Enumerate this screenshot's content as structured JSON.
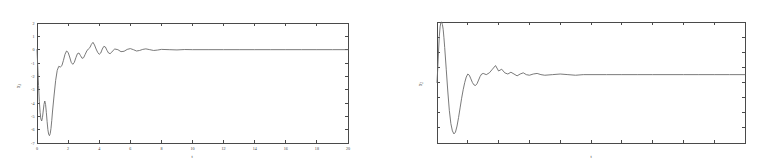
{
  "figure": {
    "caption": "",
    "background_color": "#ffffff",
    "curve_color": "#6b6b6b",
    "axis_color": "#4a4a4a"
  },
  "panels": [
    {
      "id": "left",
      "name": "left-plot",
      "ylabel": "x",
      "ylabel_sub": "1",
      "xlabel": "t",
      "x_tick_labels": [
        "0",
        "2",
        "4",
        "6",
        "8",
        "10",
        "12",
        "14",
        "16",
        "18",
        "20"
      ],
      "y_tick_labels": [
        "2",
        "1",
        "0",
        "-1",
        "-2",
        "-3",
        "-4",
        "-5",
        "-6",
        "-7"
      ]
    },
    {
      "id": "right",
      "name": "right-plot",
      "ylabel": "x",
      "ylabel_sub": "2",
      "xlabel": "t",
      "x_tick_labels": [
        "",
        "",
        "",
        "",
        "",
        "",
        "",
        "",
        "",
        "",
        ""
      ],
      "y_tick_labels": [
        "",
        "",
        "",
        "",
        "",
        "",
        "",
        ""
      ]
    }
  ],
  "chart_data": [
    {
      "type": "line",
      "id": "left",
      "title": "",
      "xlabel": "t",
      "ylabel": "x1",
      "xlim": [
        0,
        20
      ],
      "ylim": [
        -7,
        2
      ],
      "grid": false,
      "legend": "none",
      "xticks": [
        0,
        2,
        4,
        6,
        8,
        10,
        12,
        14,
        16,
        18,
        20
      ],
      "yticks": [
        2,
        1,
        0,
        -1,
        -2,
        -3,
        -4,
        -5,
        -6,
        -7
      ],
      "series": [
        {
          "name": "x1",
          "x": [
            0.0,
            0.05,
            0.1,
            0.15,
            0.2,
            0.25,
            0.3,
            0.35,
            0.4,
            0.45,
            0.5,
            0.55,
            0.6,
            0.65,
            0.7,
            0.75,
            0.8,
            0.85,
            0.9,
            0.95,
            1.0,
            1.1,
            1.2,
            1.3,
            1.4,
            1.5,
            1.6,
            1.7,
            1.8,
            1.9,
            2.0,
            2.1,
            2.2,
            2.3,
            2.4,
            2.5,
            2.6,
            2.7,
            2.8,
            2.9,
            3.0,
            3.1,
            3.2,
            3.3,
            3.4,
            3.5,
            3.6,
            3.7,
            3.8,
            3.9,
            4.0,
            4.1,
            4.2,
            4.3,
            4.4,
            4.5,
            4.6,
            4.7,
            4.8,
            4.9,
            5.0,
            5.2,
            5.4,
            5.6,
            5.8,
            6.0,
            6.2,
            6.4,
            6.6,
            6.8,
            7.0,
            7.25,
            7.5,
            7.75,
            8.0,
            8.5,
            9.0,
            9.5,
            10.0,
            11.0,
            12.0,
            13.0,
            14.0,
            15.0,
            16.0,
            17.0,
            18.0,
            19.0,
            20.0
          ],
          "y": [
            0.0,
            -1.3,
            -2.7,
            -3.9,
            -4.7,
            -5.2,
            -5.35,
            -5.1,
            -4.6,
            -4.1,
            -3.85,
            -4.1,
            -4.7,
            -5.4,
            -6.0,
            -6.35,
            -6.45,
            -6.3,
            -5.9,
            -5.3,
            -4.6,
            -3.4,
            -2.3,
            -1.55,
            -1.25,
            -1.3,
            -1.2,
            -0.8,
            -0.35,
            -0.1,
            -0.2,
            -0.55,
            -0.95,
            -1.1,
            -0.95,
            -0.6,
            -0.3,
            -0.25,
            -0.45,
            -0.65,
            -0.6,
            -0.35,
            -0.1,
            0.05,
            0.15,
            0.4,
            0.55,
            0.35,
            0.05,
            -0.2,
            -0.35,
            -0.25,
            0.05,
            0.25,
            0.2,
            -0.05,
            -0.25,
            -0.3,
            -0.2,
            -0.05,
            0.05,
            0.0,
            -0.15,
            -0.12,
            0.02,
            0.08,
            0.0,
            -0.1,
            -0.06,
            0.02,
            0.06,
            0.0,
            -0.06,
            -0.03,
            0.02,
            0.0,
            -0.02,
            0.01,
            0.0,
            0.0,
            0.0,
            0.0,
            0.0,
            0.0,
            0.0,
            0.0,
            0.0,
            0.0,
            0.0
          ]
        }
      ]
    },
    {
      "type": "line",
      "id": "right",
      "title": "",
      "xlabel": "t",
      "ylabel": "x2",
      "xlim": [
        0,
        20
      ],
      "ylim": [
        -1.0,
        1.0
      ],
      "grid": false,
      "legend": "none",
      "xticks": [
        0,
        2,
        4,
        6,
        8,
        10,
        12,
        14,
        16,
        18,
        20
      ],
      "yticks": [
        1.0,
        0.75,
        0.5,
        0.25,
        0.0,
        -0.25,
        -0.5,
        -0.75,
        -1.0
      ],
      "series": [
        {
          "name": "x2",
          "x": [
            0.0,
            0.05,
            0.1,
            0.15,
            0.2,
            0.25,
            0.3,
            0.35,
            0.4,
            0.45,
            0.5,
            0.6,
            0.7,
            0.8,
            0.9,
            1.0,
            1.1,
            1.2,
            1.3,
            1.4,
            1.5,
            1.6,
            1.7,
            1.8,
            1.9,
            2.0,
            2.1,
            2.2,
            2.3,
            2.4,
            2.5,
            2.6,
            2.7,
            2.8,
            2.9,
            3.0,
            3.2,
            3.4,
            3.6,
            3.8,
            4.0,
            4.2,
            4.4,
            4.6,
            4.8,
            5.0,
            5.2,
            5.4,
            5.6,
            5.8,
            6.0,
            6.25,
            6.5,
            6.75,
            7.0,
            7.5,
            8.0,
            8.5,
            9.0,
            9.5,
            10.0,
            11.0,
            12.0,
            13.0,
            14.0,
            15.0,
            16.0,
            17.0,
            18.0,
            19.0,
            20.0
          ],
          "y": [
            0.0,
            0.24,
            0.52,
            0.76,
            0.92,
            0.99,
            1.0,
            0.96,
            0.88,
            0.74,
            0.58,
            0.22,
            -0.14,
            -0.46,
            -0.68,
            -0.8,
            -0.85,
            -0.82,
            -0.72,
            -0.58,
            -0.42,
            -0.26,
            -0.12,
            0.0,
            0.09,
            0.14,
            0.12,
            0.06,
            0.0,
            -0.04,
            -0.05,
            -0.02,
            0.04,
            0.1,
            0.14,
            0.15,
            0.13,
            0.16,
            0.22,
            0.28,
            0.19,
            0.22,
            0.16,
            0.14,
            0.17,
            0.14,
            0.11,
            0.14,
            0.16,
            0.13,
            0.12,
            0.14,
            0.15,
            0.13,
            0.12,
            0.13,
            0.14,
            0.13,
            0.12,
            0.13,
            0.13,
            0.13,
            0.13,
            0.13,
            0.13,
            0.13,
            0.13,
            0.13,
            0.13,
            0.13,
            0.13
          ]
        }
      ]
    }
  ]
}
